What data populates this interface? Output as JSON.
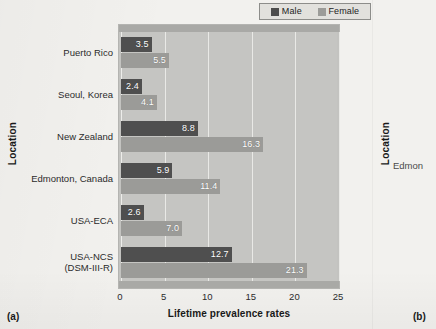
{
  "figure": {
    "panel_a_label": "(a)",
    "panel_b_label": "(b)"
  },
  "legend": {
    "position": "top-right",
    "entries": [
      {
        "label": "Male",
        "color": "#4f4f4f"
      },
      {
        "label": "Female",
        "color": "#9b9b98"
      }
    ]
  },
  "panel_b": {
    "y_axis_title": "Location",
    "visible_partial_label": "Edmon"
  },
  "chart_data": {
    "type": "bar",
    "orientation": "horizontal",
    "title": "",
    "xlabel": "Lifetime prevalence rates",
    "ylabel": "Location",
    "xlim": [
      0,
      25
    ],
    "xticks": [
      0,
      5,
      10,
      15,
      20,
      25
    ],
    "grid": true,
    "legend_position": "top-right",
    "categories": [
      "Puerto Rico",
      "Seoul, Korea",
      "New Zealand",
      "Edmonton, Canada",
      "USA-ECA",
      "USA-NCS\n(DSM-III-R)"
    ],
    "category_lines": [
      [
        "Puerto Rico"
      ],
      [
        "Seoul, Korea"
      ],
      [
        "New Zealand"
      ],
      [
        "Edmonton, Canada"
      ],
      [
        "USA-ECA"
      ],
      [
        "USA-NCS",
        "(DSM-III-R)"
      ]
    ],
    "series": [
      {
        "name": "Male",
        "color": "#4f4f4f",
        "values": [
          3.5,
          2.4,
          8.8,
          5.9,
          2.6,
          12.7
        ]
      },
      {
        "name": "Female",
        "color": "#9b9b98",
        "values": [
          5.5,
          4.1,
          16.3,
          11.4,
          7.0,
          21.3
        ]
      }
    ]
  }
}
